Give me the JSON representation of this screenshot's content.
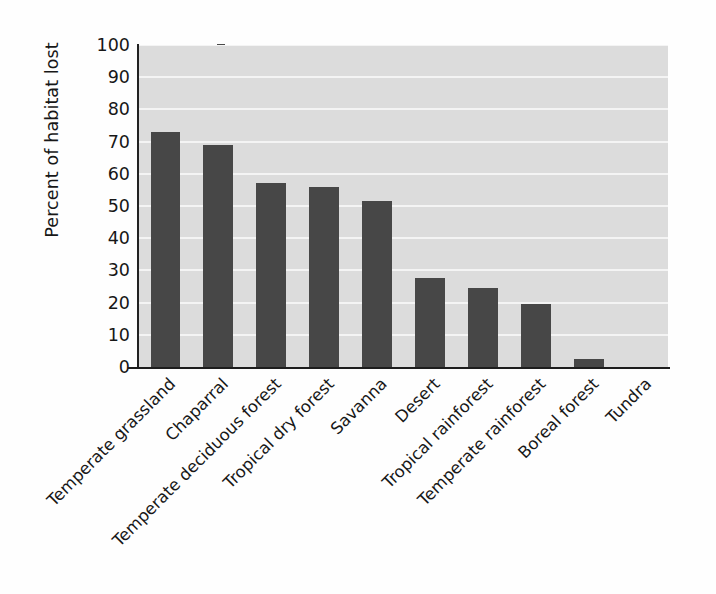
{
  "chart_data": {
    "type": "bar",
    "title": "",
    "xlabel": "",
    "ylabel": "Percent of habitat lost",
    "ylim": [
      0,
      100
    ],
    "ytick_values": [
      0,
      10,
      20,
      30,
      40,
      50,
      60,
      70,
      80,
      90,
      100
    ],
    "ytick_labels": [
      "0",
      "10",
      "20",
      "30",
      "40",
      "50",
      "60",
      "70",
      "80",
      "90",
      "100"
    ],
    "grid": true,
    "grid_axis": "y",
    "legend": "none",
    "categories": [
      "Temperate grassland",
      "Chaparral",
      "Temperate deciduous forest",
      "Tropical dry forest",
      "Savanna",
      "Desert",
      "Tropical rainforest",
      "Temperate rainforest",
      "Boreal forest",
      "Tundra"
    ],
    "values": [
      73,
      69,
      57,
      56,
      51.5,
      27.5,
      24.5,
      19.5,
      2.5,
      0
    ],
    "bar_color": "#474747",
    "plot_background_color": "#dcdcdc",
    "gridline_color": "#f4f4f4",
    "axis_color": "#1d1d1d",
    "page_background_color": "#ffffff"
  }
}
